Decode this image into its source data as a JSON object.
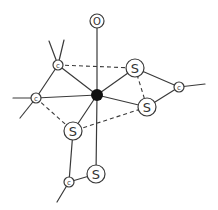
{
  "diagram": {
    "title": "",
    "colors": {
      "line": "#3a3a3a",
      "metal": "#111111",
      "background": "#ffffff"
    },
    "nodes": [
      {
        "id": "M",
        "label": "",
        "type": "metal",
        "x": 97,
        "y": 95,
        "r": 6
      },
      {
        "id": "O",
        "label": "O",
        "type": "oxygen",
        "x": 97,
        "y": 21,
        "r": 7
      },
      {
        "id": "C1",
        "label": "c",
        "type": "carbon",
        "x": 58,
        "y": 65,
        "r": 5
      },
      {
        "id": "C2",
        "label": "c",
        "type": "carbon",
        "x": 36,
        "y": 98,
        "r": 5
      },
      {
        "id": "S1",
        "label": "S",
        "type": "sulfur",
        "x": 135,
        "y": 68,
        "r": 9
      },
      {
        "id": "C3",
        "label": "c",
        "type": "carbon",
        "x": 179,
        "y": 87,
        "r": 5
      },
      {
        "id": "S2",
        "label": "S",
        "type": "sulfur",
        "x": 147,
        "y": 107,
        "r": 9
      },
      {
        "id": "S3",
        "label": "S",
        "type": "sulfur",
        "x": 73,
        "y": 131,
        "r": 9
      },
      {
        "id": "S4",
        "label": "S",
        "type": "sulfur",
        "x": 96,
        "y": 174,
        "r": 9
      },
      {
        "id": "C4",
        "label": "c",
        "type": "carbon",
        "x": 69,
        "y": 182,
        "r": 5
      }
    ],
    "bonds": [
      {
        "from": "M",
        "to": "O",
        "style": "solid"
      },
      {
        "from": "M",
        "to": "C1",
        "style": "solid"
      },
      {
        "from": "M",
        "to": "C2",
        "style": "solid"
      },
      {
        "from": "M",
        "to": "S1",
        "style": "solid"
      },
      {
        "from": "M",
        "to": "S2",
        "style": "solid"
      },
      {
        "from": "M",
        "to": "S3",
        "style": "solid"
      },
      {
        "from": "M",
        "to": "S4",
        "style": "solid"
      },
      {
        "from": "C1",
        "to": "C2",
        "style": "solid"
      },
      {
        "from": "S1",
        "to": "C3",
        "style": "solid"
      },
      {
        "from": "S2",
        "to": "C3",
        "style": "solid"
      },
      {
        "from": "S3",
        "to": "C4",
        "style": "solid"
      },
      {
        "from": "C4",
        "to": "S4",
        "style": "solid"
      },
      {
        "from": "C1",
        "to": "S1",
        "style": "dashed"
      },
      {
        "from": "S1",
        "to": "S2",
        "style": "dashed"
      },
      {
        "from": "S2",
        "to": "S3",
        "style": "dashed"
      },
      {
        "from": "C2",
        "to": "S3",
        "style": "dashed"
      }
    ],
    "stubs": [
      {
        "from": "C1",
        "x": 49,
        "y": 41
      },
      {
        "from": "C1",
        "x": 64,
        "y": 40
      },
      {
        "from": "C2",
        "x": 13,
        "y": 98
      },
      {
        "from": "C2",
        "x": 20,
        "y": 118
      },
      {
        "from": "C3",
        "x": 205,
        "y": 84
      },
      {
        "from": "C4",
        "x": 57,
        "y": 202
      }
    ]
  }
}
